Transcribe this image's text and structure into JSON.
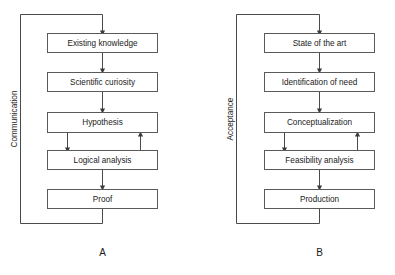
{
  "figure": {
    "background_color": "#ffffff",
    "line_color": "#4a4a4a",
    "box_stroke_color": "#5a5a5a",
    "text_color": "#1a1a1a"
  },
  "panels": [
    {
      "letter": "A",
      "side_label": "Communication",
      "boxes": [
        {
          "label": "Existing knowledge"
        },
        {
          "label": "Scientific curiosity"
        },
        {
          "label": "Hypothesis"
        },
        {
          "label": "Logical analysis"
        },
        {
          "label": "Proof"
        }
      ]
    },
    {
      "letter": "B",
      "side_label": "Acceptance",
      "boxes": [
        {
          "label": "State of the art"
        },
        {
          "label": "Identification of need"
        },
        {
          "label": "Conceptualization"
        },
        {
          "label": "Feasibility analysis"
        },
        {
          "label": "Production"
        }
      ]
    }
  ]
}
